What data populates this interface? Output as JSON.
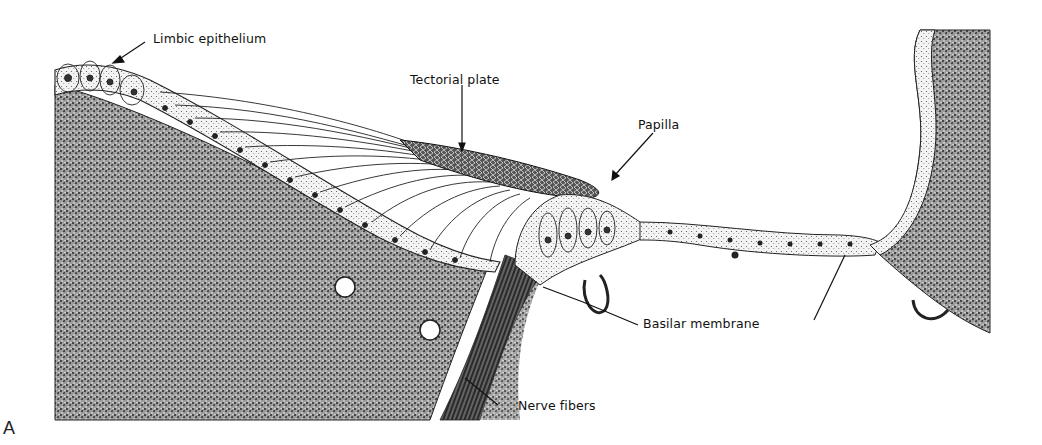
{
  "figure": {
    "panel_letter": "A",
    "labels": {
      "limbic_epithelium": "Limbic epithelium",
      "tectorial_plate": "Tectorial plate",
      "papilla": "Papilla",
      "basilar_membrane": "Basilar membrane",
      "nerve_fibers": "Nerve fibers"
    },
    "colors": {
      "ink": "#111111",
      "tissue_dark": "#3a3a3a",
      "tissue_mid": "#8a8a8a",
      "background": "#ffffff"
    }
  }
}
